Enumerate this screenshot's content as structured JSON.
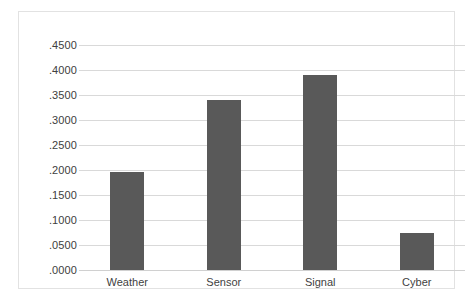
{
  "chart_data": {
    "type": "bar",
    "title": "",
    "subtitle": "",
    "xlabel": "",
    "ylabel": "",
    "categories": [
      "Weather",
      "Sensor",
      "Signal",
      "Cyber"
    ],
    "values": [
      0.1955,
      0.341,
      0.391,
      0.0745
    ],
    "series": [
      {
        "name": "",
        "values": [
          0.1955,
          0.341,
          0.391,
          0.0745
        ]
      }
    ],
    "ylim": [
      0.0,
      0.45
    ],
    "ytick_values": [
      0.0,
      0.05,
      0.1,
      0.15,
      0.2,
      0.25,
      0.3,
      0.35,
      0.4,
      0.45
    ],
    "ytick_labels": [
      ".0000",
      ".0500",
      ".1000",
      ".1500",
      ".2000",
      ".2500",
      ".3000",
      ".3500",
      ".4000",
      ".4500"
    ],
    "xtick_labels": [
      "Weather",
      "Sensor",
      "Signal",
      "Cyber"
    ],
    "legend": [],
    "legend_position": "none",
    "grid": true,
    "grid_axis": "y",
    "annotations": [],
    "colors": {
      "bar_fill": "#595959",
      "gridline": "#d9d9d9",
      "frame_border": "#e2e2e2",
      "tick_label_text": "#404040",
      "plot_background": "#ffffff"
    }
  }
}
